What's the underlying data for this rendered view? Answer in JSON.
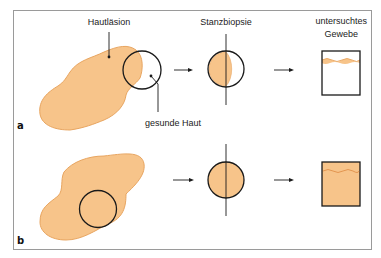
{
  "figure": {
    "panels": [
      {
        "label": "a",
        "annotations": {
          "lesion": "Hautläsion",
          "healthy_skin": "gesunde Haut",
          "punch": "Stanzbiopsie",
          "tissue_line1": "untersuchtes",
          "tissue_line2": "Gewebe"
        }
      },
      {
        "label": "b"
      }
    ],
    "colors": {
      "lesion_fill": "#f7c48a",
      "lesion_stroke": "#e8a560",
      "line": "#1a1a1a",
      "frame": "#9a9a9a"
    }
  }
}
